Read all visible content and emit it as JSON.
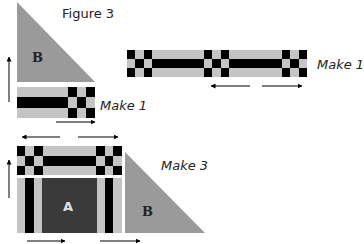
{
  "figure": {
    "title": "Figure 3",
    "colors": {
      "light": "#c4c4c4",
      "black": "#000000",
      "dark_center": "#3a3a3a",
      "triangle": "#9a9a9a",
      "arrow": "#000000",
      "background": "#ffffff"
    },
    "units": [
      {
        "id": "unit-top-left",
        "triangle_label": "B",
        "instruction": "Make 1",
        "description": "Triangle B above a strip with a checkered end on the right"
      },
      {
        "id": "unit-top-right",
        "instruction": "Make 1",
        "description": "Long strip with three checkered sections"
      },
      {
        "id": "unit-bottom",
        "center_label": "A",
        "triangle_label": "B",
        "instruction": "Make 3",
        "description": "Checkered strip above block A, with triangle B to the right"
      }
    ]
  }
}
